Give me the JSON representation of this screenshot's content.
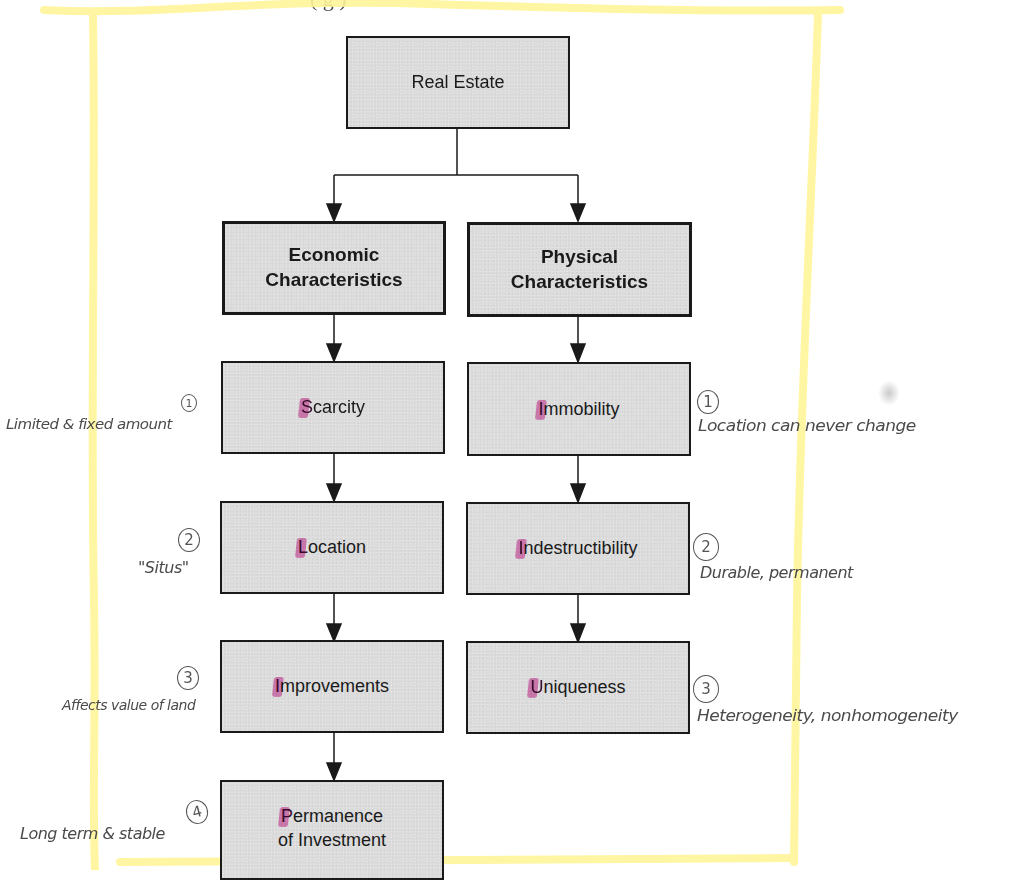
{
  "header": {
    "partial_text": "(   g   )"
  },
  "highlight": {
    "color": "#fff59a"
  },
  "diagram": {
    "root": {
      "label": "Real Estate"
    },
    "branches": [
      {
        "title_line1": "Economic",
        "title_line2": "Characteristics",
        "items": [
          {
            "first_letter": "S",
            "rest": "carcity",
            "note_number": "1",
            "note_text": "Limited & fixed amount"
          },
          {
            "first_letter": "L",
            "rest": "ocation",
            "note_number": "2",
            "note_text": "\"Situs\""
          },
          {
            "first_letter": "I",
            "rest": "mprovements",
            "note_number": "3",
            "note_text": "Affects value of land"
          },
          {
            "first_letter": "P",
            "rest": "ermanence",
            "line2": "of Investment",
            "note_number": "4",
            "note_text": "Long term & stable"
          }
        ]
      },
      {
        "title_line1": "Physical",
        "title_line2": "Characteristics",
        "items": [
          {
            "first_letter": "I",
            "rest": "mmobility",
            "note_number": "1",
            "note_text": "Location can never change"
          },
          {
            "first_letter": "I",
            "rest": "ndestructibility",
            "note_number": "2",
            "note_text": "Durable, permanent"
          },
          {
            "first_letter": "U",
            "rest": "niqueness",
            "note_number": "3",
            "note_text": "Heterogeneity, nonhomogeneity"
          }
        ]
      }
    ],
    "colors": {
      "box_fill": "#dcdcdc",
      "box_border": "#1a1a1a",
      "highlight_pink": "#d62896",
      "ink": "#4a4a4a"
    }
  }
}
